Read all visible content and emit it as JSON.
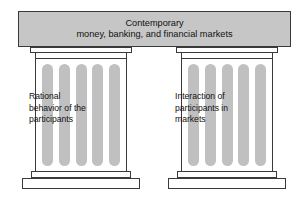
{
  "diagram": {
    "type": "classical-column-metaphor",
    "entablature": {
      "line1": "Contemporary",
      "line2": "money, banking, and financial markets"
    },
    "columns": [
      {
        "id": "left",
        "flute_count": 5,
        "text_lines": [
          "Rational",
          "behavior of the",
          "participants"
        ]
      },
      {
        "id": "right",
        "flute_count": 5,
        "text_lines": [
          "Interaction of",
          "participants in",
          "markets"
        ]
      }
    ],
    "colors": {
      "entablature_fill": "#c6c6c6",
      "flute_fill": "#c0c0c0",
      "stroke": "#3a3a3a",
      "slab_fill": "#ffffff",
      "text": "#111111",
      "background": "#ffffff"
    }
  }
}
